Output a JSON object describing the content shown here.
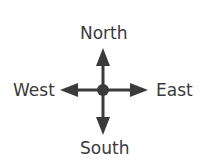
{
  "diagram": {
    "directions": {
      "north": "North",
      "south": "South",
      "east": "East",
      "west": "West"
    },
    "color": "#3a3a3a"
  }
}
